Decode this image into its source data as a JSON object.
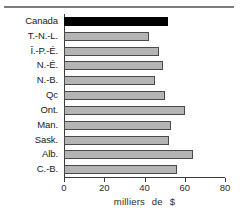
{
  "chart_data": {
    "type": "bar",
    "orientation": "horizontal",
    "title": "",
    "xlabel": "milliers de $",
    "ylabel": "",
    "xlim": [
      0,
      80
    ],
    "grid": false,
    "legend": null,
    "xticks": [
      0,
      20,
      40,
      60,
      80
    ],
    "xtick_labels": [
      "0",
      "20",
      "40",
      "60",
      "80"
    ],
    "categories": [
      "Canada",
      "T.-N.-L.",
      "Î.-P.-É.",
      "N.-É.",
      "N.-B.",
      "Qc",
      "Ont.",
      "Man.",
      "Sask.",
      "Alb.",
      "C.-B."
    ],
    "values": [
      51.7,
      42.0,
      47.0,
      49.0,
      45.0,
      50.0,
      60.0,
      53.0,
      52.0,
      64.0,
      56.0
    ],
    "highlight_index": 0,
    "colors": {
      "bar_fill": "#b4b4b4",
      "bar_border": "#4a4a4a",
      "highlight_fill": "#000000",
      "axis": "#3a3a3a",
      "rule": "#7d7d7d",
      "text": "#1a1a1a",
      "background": "#ffffff"
    }
  },
  "axis_title_parts": {
    "word1": "milliers",
    "word2": "de",
    "word3": "$"
  }
}
